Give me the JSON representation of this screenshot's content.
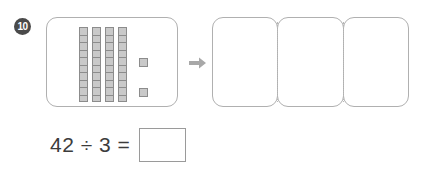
{
  "question": {
    "number": "10"
  },
  "model": {
    "panel_name": "base-ten-blocks-panel",
    "rod_count": 4,
    "units_per_rod": 10,
    "loose_units": 2,
    "total_value": 42
  },
  "arrow": {
    "icon": "arrow-right-icon"
  },
  "groups": {
    "count": 3,
    "boxes": [
      {
        "label": "",
        "value": ""
      },
      {
        "label": "",
        "value": ""
      },
      {
        "label": "",
        "value": ""
      }
    ]
  },
  "equation": {
    "text": "42 ÷ 3 =",
    "dividend": "42",
    "operator": "÷",
    "divisor": "3",
    "equals": "=",
    "answer_value": "",
    "answer_placeholder": ""
  },
  "colors": {
    "badge_fill": "#4a4a4a",
    "badge_text": "#ffffff",
    "panel_border": "#b0b0b0",
    "block_fill": "#c9c9c9",
    "block_border": "#8c8c8c",
    "divider": "#b8b8b8",
    "arrow": "#a8a8a8",
    "text": "#3c3c3c",
    "answer_border": "#9a9a9a",
    "background": "#ffffff"
  }
}
